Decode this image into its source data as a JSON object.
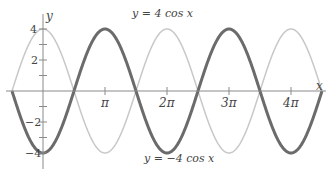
{
  "chart_data": {
    "type": "line",
    "title": "",
    "xlabel": "x",
    "ylabel": "y",
    "xlim": [
      -1.5708,
      14.137
    ],
    "ylim": [
      -4,
      4
    ],
    "grid": false,
    "legend": "none (inline curve labels)",
    "x_ticks": [
      {
        "value": 3.1416,
        "label": "π"
      },
      {
        "value": 6.2832,
        "label": "2π"
      },
      {
        "value": 9.4248,
        "label": "3π"
      },
      {
        "value": 12.5664,
        "label": "4π"
      }
    ],
    "y_ticks": [
      {
        "value": 4,
        "label": "4"
      },
      {
        "value": 3,
        "label": ""
      },
      {
        "value": 2,
        "label": "2"
      },
      {
        "value": 1,
        "label": ""
      },
      {
        "value": -1,
        "label": ""
      },
      {
        "value": -2,
        "label": "−2"
      },
      {
        "value": -3,
        "label": ""
      },
      {
        "value": -4,
        "label": "−4"
      }
    ],
    "series": [
      {
        "name": "y = 4 cos x",
        "color": "#c8c8c8",
        "width": 1.5,
        "function": "4*cos(x)",
        "x": [
          -1.5708,
          0,
          1.5708,
          3.1416,
          4.7124,
          6.2832,
          7.854,
          9.4248,
          10.9956,
          12.5664,
          14.137
        ],
        "values": [
          0,
          4,
          0,
          -4,
          0,
          4,
          0,
          -4,
          0,
          4,
          0
        ]
      },
      {
        "name": "y = −4 cos x",
        "color": "#6b6b6b",
        "width": 3,
        "function": "-4*cos(x)",
        "x": [
          -1.5708,
          0,
          1.5708,
          3.1416,
          4.7124,
          6.2832,
          7.854,
          9.4248,
          10.9956,
          12.5664,
          14.137
        ],
        "values": [
          0,
          -4,
          0,
          4,
          0,
          -4,
          0,
          4,
          0,
          -4,
          0
        ]
      }
    ],
    "annotations": [
      {
        "text": "y = 4 cos x",
        "position": "top, above curve near 2π"
      },
      {
        "text": "y = −4 cos x",
        "position": "bottom, below curve near 2π"
      }
    ]
  },
  "labels": {
    "y_axis": "y",
    "x_axis": "x",
    "top_curve": "y = 4 cos x",
    "bottom_curve": "y = −4 cos x",
    "tick_pi": "π",
    "tick_2pi": "2π",
    "tick_3pi": "3π",
    "tick_4pi": "4π",
    "tick_4": "4",
    "tick_2": "2",
    "tick_m2": "−2",
    "tick_m4": "−4"
  }
}
